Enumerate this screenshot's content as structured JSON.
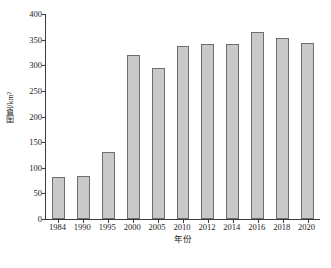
{
  "chart_data": {
    "type": "bar",
    "title": "",
    "subtitle": "",
    "xlabel": "年份",
    "ylabel": "围垦/km²",
    "categories": [
      "1984",
      "1990",
      "1995",
      "2000",
      "2005",
      "2010",
      "2012",
      "2014",
      "2016",
      "2018",
      "2020"
    ],
    "values": [
      82,
      84,
      131,
      320,
      295,
      338,
      342,
      342,
      365,
      353,
      344
    ],
    "series": [
      {
        "name": "围垦面积",
        "values": [
          82,
          84,
          131,
          320,
          295,
          338,
          342,
          342,
          365,
          353,
          344
        ]
      }
    ],
    "ylim": [
      0,
      400
    ],
    "ytick_labels": [
      "0",
      "50",
      "100",
      "150",
      "200",
      "250",
      "300",
      "350",
      "400"
    ],
    "ytick_values": [
      0,
      50,
      100,
      150,
      200,
      250,
      300,
      350,
      400
    ],
    "grid": false,
    "legend": null,
    "legend_position": "none",
    "bar_color": "#c9c9c9",
    "bar_edge_color": "#6e6e6e",
    "axis_color": "#3a3a3a",
    "background_color": "#ffffff",
    "tick_direction": "out"
  }
}
